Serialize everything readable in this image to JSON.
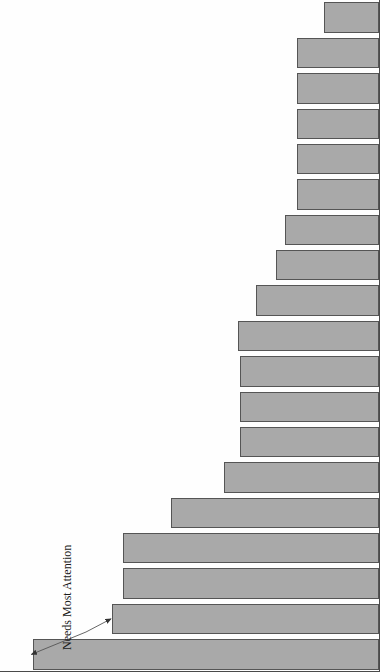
{
  "chart_data": {
    "type": "bar",
    "orientation": "vertical",
    "title": "",
    "xlabel": "",
    "ylabel": "Risk Priority Numbers",
    "ylim": [
      0,
      300
    ],
    "ytick_values": [
      0,
      50,
      100,
      150,
      200,
      250,
      300
    ],
    "ytick_labels": [
      "0",
      "50",
      "100",
      "150",
      "200",
      "250",
      "300"
    ],
    "grid": false,
    "legend": null,
    "bar_color": "#a9a9a9",
    "bar_edge_color": "#555555",
    "categories": [
      "Chip Braker Angle Ground Incorrectly",
      "",
      "",
      "",
      "",
      "",
      "Sharp Die Edge",
      "",
      "",
      "",
      "",
      "Misaligned Pusher",
      "",
      "",
      "",
      "Worn/Loose Insert",
      "",
      "",
      ""
    ],
    "labeled_categories": [
      {
        "index": 0,
        "label": "Chip Braker Angle Ground Incorrectly"
      },
      {
        "index": 3,
        "label": "Chip Braker Angle Ground Incorrectly"
      },
      {
        "index": 6,
        "label": "Sharp Die Edge"
      },
      {
        "index": 11,
        "label": "Misaligned Pusher"
      },
      {
        "index": 15,
        "label": "Worn/Loose Insert"
      }
    ],
    "values": [
      275,
      212,
      203,
      203,
      165,
      123,
      110,
      110,
      110,
      112,
      98,
      82,
      75,
      65,
      65,
      65,
      65,
      65,
      44
    ],
    "annotations": [
      {
        "text": "Needs Most Attention",
        "points_to_indices": [
          0,
          1
        ]
      }
    ]
  },
  "axis": {
    "value_axis_title": "Risk Priority Numbers",
    "category_axis_ticks": [
      "Chip Braker Angle Ground Incorrectly",
      "Sharp Die Edge",
      "Misaligned Pusher",
      "Worn/Loose Insert"
    ]
  },
  "annotation": {
    "text": "Needs Most Attention"
  }
}
